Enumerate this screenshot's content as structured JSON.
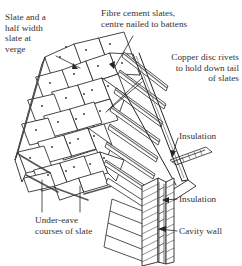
{
  "figure": {
    "domain": "diagram",
    "background_color": "#ffffff",
    "ink_color": "#262626",
    "text_color": "#333030",
    "shade_color": "#8a8a8a"
  },
  "labels": {
    "slate_half_width": "Slate and a\nhalf width\nslate at\nverge",
    "fibre_cement": "Fibre cement slates,\ncentre nailed to battens",
    "copper_rivets": "Copper disc rivets\nto hold down tail\nof slates",
    "insulation_roof": "Insulation",
    "insulation_wall": "Insulation",
    "cavity_wall": "Cavity wall",
    "under_eave": "Under-eave\ncourses of slate"
  },
  "callouts": [
    {
      "name": "slate-half-width-leader",
      "target": "verge slate course, upper left of roof plane"
    },
    {
      "name": "fibre-cement-leader",
      "target": "slate near roof ridge, centre nail point"
    },
    {
      "name": "copper-rivets-leader",
      "target": "slate tail batten line, right of roof plane"
    },
    {
      "name": "insulation-roof-leader",
      "target": "eaves insulation layer above wall head"
    },
    {
      "name": "insulation-wall-leader",
      "target": "cavity insulation batt in wall section"
    },
    {
      "name": "cavity-wall-leader",
      "target": "outer leaf of cavity wall"
    },
    {
      "name": "under-eave-leader-left",
      "target": "lowest slate course at eave"
    },
    {
      "name": "under-eave-leader-right",
      "target": "under-eave short course of slate"
    }
  ],
  "components": [
    {
      "name": "roof-slate-field",
      "description": "staggered courses of fibre cement slates in isometric view"
    },
    {
      "name": "verge-edge",
      "description": "left roof verge with half-width slates and edge board"
    },
    {
      "name": "batten-set",
      "description": "exposed horizontal battens on right of roof plane"
    },
    {
      "name": "rafter-line",
      "description": "sloping rafter / barge line at right"
    },
    {
      "name": "eaves-overhang",
      "description": "soffit and fascia overhang at wall head"
    },
    {
      "name": "cavity-wall-section",
      "description": "hatched vertical cavity wall with two leaves"
    },
    {
      "name": "wall-insulation-batt",
      "description": "insulation within wall cavity"
    },
    {
      "name": "nail-dots",
      "description": "small centre-nail and rivet marks on slates"
    }
  ]
}
